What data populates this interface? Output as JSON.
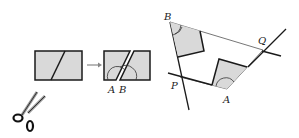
{
  "figure": {
    "left_panel": {
      "labels": {
        "a": "A",
        "b": "B"
      },
      "arrow": "arrow-right"
    },
    "right_panel": {
      "labels": {
        "b": "B",
        "q": "Q",
        "a": "A",
        "p": "P"
      }
    },
    "colors": {
      "fill": "#d9d9d9",
      "stroke": "#1a1a1a",
      "thin_line": "#777777",
      "arrow": "#888888"
    }
  }
}
